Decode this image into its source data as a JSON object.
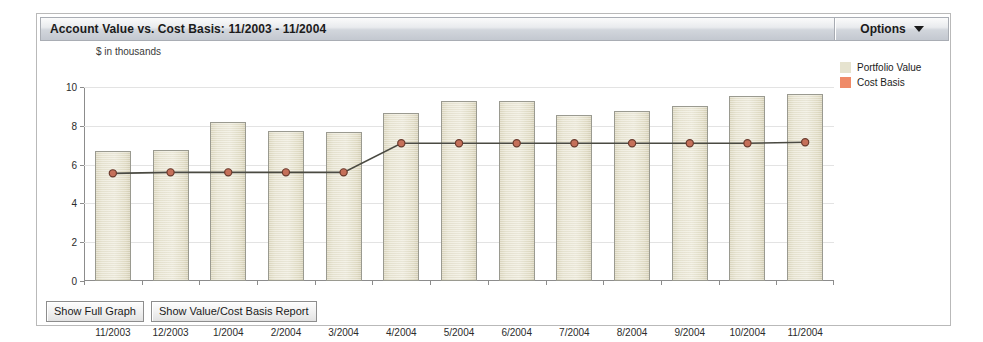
{
  "header": {
    "title": "Account Value vs. Cost Basis:  11/2003 - 11/2004",
    "options_label": "Options",
    "options_caret_icon": "chevron-down-icon"
  },
  "legend": {
    "items": [
      {
        "label": "Portfolio Value",
        "color": "#e6e3cf"
      },
      {
        "label": "Cost Basis",
        "color": "#ef8a68"
      }
    ]
  },
  "footer": {
    "buttons": [
      {
        "label": "Show Full Graph"
      },
      {
        "label": "Show Value/Cost Basis Report"
      }
    ]
  },
  "chart_data": {
    "type": "bar",
    "title": "Account Value vs. Cost Basis:  11/2003 - 11/2004",
    "subtitle": "$ in thousands",
    "xlabel": "",
    "ylabel": "$ in thousands",
    "ylim": [
      0,
      10
    ],
    "yticks": [
      0,
      2,
      4,
      6,
      8,
      10
    ],
    "ytick_labels": [
      "0",
      "2",
      "4",
      "6",
      "8",
      "10"
    ],
    "grid": true,
    "legend_position": "right",
    "categories": [
      "11/2003",
      "12/2003",
      "1/2004",
      "2/2004",
      "3/2004",
      "4/2004",
      "5/2004",
      "6/2004",
      "7/2004",
      "8/2004",
      "9/2004",
      "10/2004",
      "11/2004"
    ],
    "series": [
      {
        "name": "Portfolio Value",
        "type": "bar",
        "color": "#e6e3cf",
        "values": [
          6.7,
          6.75,
          8.2,
          7.75,
          7.7,
          8.65,
          9.3,
          9.3,
          8.55,
          8.75,
          9.0,
          9.55,
          9.65
        ]
      },
      {
        "name": "Cost Basis",
        "type": "line",
        "color": "#c5705a",
        "line_color": "#4a4a42",
        "values": [
          5.55,
          5.6,
          5.6,
          5.6,
          5.6,
          7.1,
          7.1,
          7.1,
          7.1,
          7.1,
          7.1,
          7.1,
          7.15
        ]
      }
    ]
  }
}
